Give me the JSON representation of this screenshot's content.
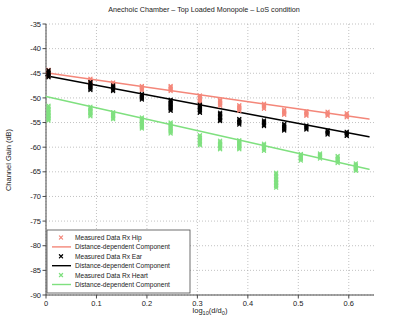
{
  "chart_data": {
    "type": "scatter",
    "title": "Anechoic Chamber – Top Loaded Monopole – LoS condition",
    "xlabel": "log10(d/d0)",
    "ylabel": "Channel Gain (dB)",
    "xlim": [
      0,
      0.65
    ],
    "ylim": [
      -90,
      -35
    ],
    "xticks": [
      0,
      0.1,
      0.2,
      0.3,
      0.4,
      0.5,
      0.6
    ],
    "xticklabels": [
      "0",
      "0.1",
      "0.2",
      "0.3",
      "0.4",
      "0.5",
      "0.6"
    ],
    "yticks": [
      -35,
      -40,
      -45,
      -50,
      -55,
      -60,
      -65,
      -70,
      -75,
      -80,
      -85,
      -90
    ],
    "yticklabels": [
      "-35",
      "-40",
      "-45",
      "-50",
      "-55",
      "-60",
      "-65",
      "-70",
      "-75",
      "-80",
      "-85",
      "-90"
    ],
    "grid": true,
    "grid_style": "dotted",
    "legend_position": "lower left",
    "colors": {
      "hip": "#f4877a",
      "hip_line": "#f4877a",
      "ear": "#000000",
      "ear_line": "#000000",
      "heart": "#7fe07f",
      "heart_line": "#7fe07f",
      "grid": "#a8a8a8",
      "axis": "#4a4a4a"
    },
    "series": [
      {
        "name": "Measured Data Rx Hip",
        "key": "hip",
        "marker": "x",
        "color": "#f4877a",
        "clusters": [
          {
            "x": 0.005,
            "lo": -45.6,
            "hi": -44.3
          },
          {
            "x": 0.088,
            "lo": -47.3,
            "hi": -46.1
          },
          {
            "x": 0.133,
            "lo": -48.0,
            "hi": -46.9
          },
          {
            "x": 0.19,
            "lo": -48.5,
            "hi": -47.6
          },
          {
            "x": 0.247,
            "lo": -48.6,
            "hi": -47.6
          },
          {
            "x": 0.305,
            "lo": -51.1,
            "hi": -49.5
          },
          {
            "x": 0.345,
            "lo": -51.6,
            "hi": -50.4
          },
          {
            "x": 0.383,
            "lo": -52.6,
            "hi": -51.5
          },
          {
            "x": 0.432,
            "lo": -52.2,
            "hi": -51.2
          },
          {
            "x": 0.472,
            "lo": -53.4,
            "hi": -52.4
          },
          {
            "x": 0.516,
            "lo": -53.6,
            "hi": -52.7
          },
          {
            "x": 0.558,
            "lo": -53.6,
            "hi": -52.8
          },
          {
            "x": 0.596,
            "lo": -53.9,
            "hi": -53.1
          }
        ]
      },
      {
        "name": "Measured Data Rx Ear",
        "key": "ear",
        "marker": "x",
        "color": "#000000",
        "clusters": [
          {
            "x": 0.005,
            "lo": -45.8,
            "hi": -44.4
          },
          {
            "x": 0.088,
            "lo": -48.4,
            "hi": -46.8
          },
          {
            "x": 0.133,
            "lo": -48.6,
            "hi": -47.5
          },
          {
            "x": 0.19,
            "lo": -50.3,
            "hi": -49.2
          },
          {
            "x": 0.247,
            "lo": -52.6,
            "hi": -50.4
          },
          {
            "x": 0.305,
            "lo": -53.0,
            "hi": -51.4
          },
          {
            "x": 0.345,
            "lo": -54.7,
            "hi": -53.0
          },
          {
            "x": 0.383,
            "lo": -55.4,
            "hi": -54.3
          },
          {
            "x": 0.432,
            "lo": -55.7,
            "hi": -54.6
          },
          {
            "x": 0.472,
            "lo": -56.6,
            "hi": -55.3
          },
          {
            "x": 0.516,
            "lo": -56.4,
            "hi": -55.6
          },
          {
            "x": 0.558,
            "lo": -57.4,
            "hi": -56.6
          },
          {
            "x": 0.596,
            "lo": -57.7,
            "hi": -56.9
          }
        ]
      },
      {
        "name": "Measured Data Rx Heart",
        "key": "heart",
        "marker": "x",
        "color": "#7fe07f",
        "clusters": [
          {
            "x": 0.005,
            "lo": -54.6,
            "hi": -51.6
          },
          {
            "x": 0.088,
            "lo": -53.7,
            "hi": -51.8
          },
          {
            "x": 0.133,
            "lo": -54.3,
            "hi": -52.9
          },
          {
            "x": 0.19,
            "lo": -56.2,
            "hi": -54.0
          },
          {
            "x": 0.247,
            "lo": -57.2,
            "hi": -55.0
          },
          {
            "x": 0.305,
            "lo": -59.6,
            "hi": -57.6
          },
          {
            "x": 0.345,
            "lo": -60.4,
            "hi": -58.7
          },
          {
            "x": 0.383,
            "lo": -60.4,
            "hi": -58.6
          },
          {
            "x": 0.432,
            "lo": -60.7,
            "hi": -59.3
          },
          {
            "x": 0.456,
            "lo": -68.2,
            "hi": -65.2
          },
          {
            "x": 0.505,
            "lo": -62.7,
            "hi": -61.4
          },
          {
            "x": 0.543,
            "lo": -62.3,
            "hi": -61.3
          },
          {
            "x": 0.578,
            "lo": -63.2,
            "hi": -61.8
          },
          {
            "x": 0.614,
            "lo": -64.8,
            "hi": -63.3
          }
        ]
      }
    ],
    "fit_lines": [
      {
        "name": "Distance-dependent Component",
        "key": "hip_fit",
        "color": "#f4877a",
        "x0": 0.0,
        "y0": -44.9,
        "x1": 0.64,
        "y1": -54.3
      },
      {
        "name": "Distance-dependent Component",
        "key": "ear_fit",
        "color": "#000000",
        "x0": 0.0,
        "y0": -45.5,
        "x1": 0.64,
        "y1": -57.9
      },
      {
        "name": "Distance-dependent Component",
        "key": "heart_fit",
        "color": "#7fe07f",
        "x0": 0.0,
        "y0": -49.7,
        "x1": 0.64,
        "y1": -64.5
      }
    ],
    "legend": [
      {
        "label": "Measured Data Rx Hip",
        "type": "marker",
        "color": "#f4877a"
      },
      {
        "label": "Distance-dependent Component",
        "type": "line",
        "color": "#f4877a"
      },
      {
        "label": "Measured Data Rx Ear",
        "type": "marker",
        "color": "#000000"
      },
      {
        "label": "Distance-dependent Component",
        "type": "line",
        "color": "#000000"
      },
      {
        "label": "Measured Data Rx Heart",
        "type": "marker",
        "color": "#7fe07f"
      },
      {
        "label": "Distance-dependent Component",
        "type": "line",
        "color": "#7fe07f"
      }
    ]
  }
}
